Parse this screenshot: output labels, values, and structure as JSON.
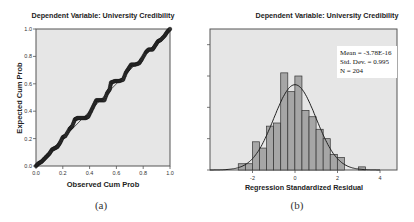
{
  "figure": {
    "panels": [
      {
        "caption": "(a)"
      },
      {
        "caption": "(b)"
      }
    ]
  },
  "chart_data": [
    {
      "type": "scatter",
      "subtype": "normal P-P plot of regression standardized residual",
      "title": "Dependent Variable: University Credibility",
      "xlabel": "Observed Cum Prob",
      "ylabel": "Expected Cum Prob",
      "xlim": [
        0.0,
        1.0
      ],
      "ylim": [
        0.0,
        1.0
      ],
      "x_ticks": [
        "0.0",
        "0.2",
        "0.4",
        "0.6",
        "0.8",
        "1.0"
      ],
      "y_ticks": [
        "0.0",
        "0.2",
        "0.4",
        "0.6",
        "0.8",
        "1.0"
      ],
      "grid": false,
      "reference_line": "diagonal y = x",
      "points_approx": [
        [
          0.0,
          0.0
        ],
        [
          0.02,
          0.02
        ],
        [
          0.04,
          0.03
        ],
        [
          0.06,
          0.05
        ],
        [
          0.08,
          0.07
        ],
        [
          0.1,
          0.09
        ],
        [
          0.12,
          0.12
        ],
        [
          0.14,
          0.13
        ],
        [
          0.16,
          0.14
        ],
        [
          0.18,
          0.17
        ],
        [
          0.2,
          0.21
        ],
        [
          0.22,
          0.22
        ],
        [
          0.25,
          0.27
        ],
        [
          0.27,
          0.29
        ],
        [
          0.29,
          0.34
        ],
        [
          0.31,
          0.35
        ],
        [
          0.34,
          0.35
        ],
        [
          0.37,
          0.35
        ],
        [
          0.39,
          0.36
        ],
        [
          0.41,
          0.4
        ],
        [
          0.43,
          0.44
        ],
        [
          0.45,
          0.48
        ],
        [
          0.48,
          0.48
        ],
        [
          0.51,
          0.48
        ],
        [
          0.53,
          0.53
        ],
        [
          0.55,
          0.56
        ],
        [
          0.56,
          0.61
        ],
        [
          0.59,
          0.62
        ],
        [
          0.62,
          0.62
        ],
        [
          0.65,
          0.63
        ],
        [
          0.67,
          0.68
        ],
        [
          0.69,
          0.71
        ],
        [
          0.71,
          0.74
        ],
        [
          0.74,
          0.74
        ],
        [
          0.77,
          0.75
        ],
        [
          0.79,
          0.78
        ],
        [
          0.82,
          0.83
        ],
        [
          0.84,
          0.85
        ],
        [
          0.87,
          0.85
        ],
        [
          0.89,
          0.88
        ],
        [
          0.91,
          0.91
        ],
        [
          0.93,
          0.92
        ],
        [
          0.96,
          0.95
        ],
        [
          0.98,
          0.98
        ],
        [
          1.0,
          1.0
        ]
      ]
    },
    {
      "type": "bar",
      "subtype": "histogram with normal curve",
      "title": "Dependent Variable: University Credibility",
      "xlabel": "Regression Standardized Residual",
      "ylabel": "Frequency",
      "xlim": [
        -4.0,
        4.8
      ],
      "ylim": [
        0,
        45
      ],
      "x_ticks": [
        "-2",
        "0",
        "2",
        "4"
      ],
      "y_ticks": [
        "0",
        "10",
        "20",
        "30",
        "40"
      ],
      "bin_width": 0.333,
      "bin_start": -2.67,
      "values": [
        2,
        2,
        9,
        7,
        14,
        15,
        31,
        25,
        30,
        19,
        17,
        13,
        10,
        5,
        4,
        0,
        0,
        1
      ],
      "legend": {
        "position": "upper right",
        "lines": [
          "Mean = -3.78E-16",
          "Std. Dev. = 0.995",
          "N = 204"
        ]
      },
      "stats": {
        "mean": "-3.78E-16",
        "std_dev": "0.995",
        "n": 204
      },
      "normal_curve": {
        "mean": 0,
        "sd": 0.995
      }
    }
  ]
}
